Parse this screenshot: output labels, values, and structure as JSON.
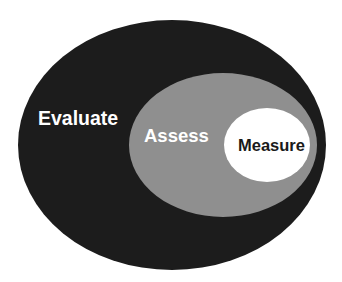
{
  "diagram": {
    "type": "nested-ellipses",
    "levels": [
      {
        "id": "evaluate",
        "label": "Evaluate",
        "fill": "#1c1c1c",
        "text_color": "#ffffff",
        "ellipse": {
          "cx": 172,
          "cy": 145,
          "rx": 154,
          "ry": 125
        },
        "text_pos": {
          "x": 38,
          "y": 125,
          "size": 19.5
        }
      },
      {
        "id": "assess",
        "label": "Assess",
        "fill": "#8f8f8f",
        "text_color": "#ffffff",
        "ellipse": {
          "cx": 223,
          "cy": 145,
          "rx": 94,
          "ry": 72
        },
        "text_pos": {
          "x": 144,
          "y": 142,
          "size": 18.5
        }
      },
      {
        "id": "measure",
        "label": "Measure",
        "fill": "#ffffff",
        "text_color": "#1a1a1a",
        "ellipse": {
          "cx": 267,
          "cy": 145,
          "rx": 43,
          "ry": 37
        },
        "text_pos": {
          "x": 238,
          "y": 151,
          "size": 16.5
        }
      }
    ]
  }
}
